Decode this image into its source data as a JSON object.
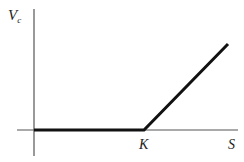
{
  "diagram": {
    "y_axis_label": "V",
    "y_axis_subscript": "c",
    "x_axis_label": "S",
    "strike_label": "K",
    "colors": {
      "axis": "#555555",
      "payoff": "#111111",
      "text": "#222222"
    }
  }
}
